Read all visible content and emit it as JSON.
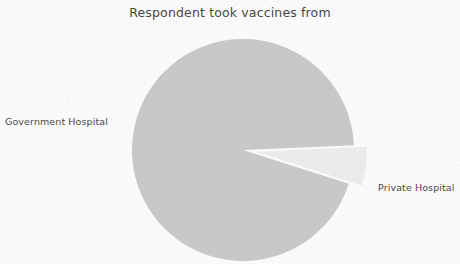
{
  "chart_data": {
    "type": "pie",
    "title": "Respondent took vaccines from",
    "categories": [
      "Government Hospital",
      "Private Hospital"
    ],
    "values": [
      94.4,
      5.6
    ],
    "labels": [
      "Government Hospital",
      "Private Hospital"
    ],
    "colors": [
      "#c9c9c9",
      "#efefef"
    ],
    "exploded": [
      false,
      true
    ],
    "start_angle": 0,
    "direction": "counterclockwise",
    "legend": "none",
    "grid": false,
    "xlabel": "",
    "ylabel": ""
  },
  "figure": {
    "title": "Respondent took vaccines from",
    "background_color": "#ffffff",
    "title_color": "#3c3c3c",
    "label_color": "#4a4a4a"
  },
  "slices": [
    {
      "name": "government-hospital",
      "label": "Government Hospital",
      "value": 94.4,
      "color": "#c9c9c9"
    },
    {
      "name": "private-hospital",
      "label": "Private Hospital",
      "value": 5.6,
      "color": "#efefef"
    }
  ]
}
